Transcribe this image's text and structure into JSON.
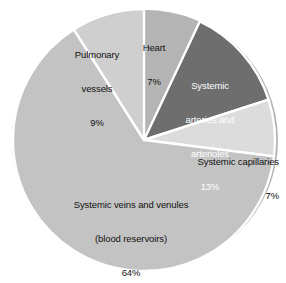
{
  "chart_data": {
    "type": "pie",
    "title": "",
    "subtitle": "",
    "xlabel": "",
    "ylabel": "",
    "legend_position": "none",
    "grid": false,
    "value_unit": "%",
    "total": 100,
    "categories": [
      "Heart",
      "Systemic arteries and arterioles",
      "Systemic capillaries",
      "Systemic veins and venules (blood reservoirs)",
      "Pulmonary vessels"
    ],
    "values": [
      7,
      13,
      7,
      64,
      9
    ],
    "slices": [
      {
        "id": "heart",
        "name": "Heart",
        "label_lines": [
          "Heart",
          "7%"
        ],
        "value": 7,
        "value_text": "7%",
        "color": "#e3e3e3",
        "text_color": "#111111",
        "start_angle": 0,
        "end_angle": 25.2
      },
      {
        "id": "systemic-arteries",
        "name": "Systemic arteries and arterioles",
        "label_lines": [
          "Systemic",
          "arteries and",
          "arterioles",
          "13%"
        ],
        "value": 13,
        "value_text": "13%",
        "color": "#6e6e6e",
        "text_color": "#ffffff",
        "start_angle": 25.2,
        "end_angle": 72.0
      },
      {
        "id": "systemic-capillaries",
        "name": "Systemic capillaries",
        "label_lines": [
          "Systemic capillaries",
          "7%"
        ],
        "value": 7,
        "value_text": "7%",
        "color": "#dcdcdc",
        "text_color": "#111111",
        "start_angle": 72.0,
        "end_angle": 97.2
      },
      {
        "id": "systemic-veins",
        "name": "Systemic veins and venules (blood reservoirs)",
        "label_lines": [
          "Systemic veins and venules",
          "(blood reservoirs)",
          "64%"
        ],
        "value": 64,
        "value_text": "64%",
        "color": "#c3c3c3",
        "text_color": "#111111",
        "start_angle": 97.2,
        "end_angle": 327.6
      },
      {
        "id": "pulmonary-vessels",
        "name": "Pulmonary vessels",
        "label_lines": [
          "Pulmonary",
          "vessels",
          "9%"
        ],
        "value": 9,
        "value_text": "9%",
        "color": "#cfcfcf",
        "text_color": "#111111",
        "start_angle": 327.6,
        "end_angle": 360
      }
    ]
  },
  "labels": {
    "heart": {
      "line1": "Heart",
      "line2": "7%"
    },
    "pulmonary": {
      "line1": "Pulmonary",
      "line2": "vessels",
      "line3": "9%"
    },
    "arteries": {
      "line1": "Systemic",
      "line2": "arteries and",
      "line3": "arterioles",
      "line4": "13%"
    },
    "capillaries": {
      "line1": "Systemic capillaries",
      "line2": "7%"
    },
    "veins": {
      "line1": "Systemic veins and venules",
      "line2": "(blood reservoirs)",
      "line3": "64%"
    }
  },
  "style": {
    "background": "#ffffff",
    "separator_color": "#ffffff",
    "shadow_color": "#b4b4b4",
    "dark_slice_color": "#6e6e6e",
    "light_slice_color": "#e3e3e3"
  }
}
